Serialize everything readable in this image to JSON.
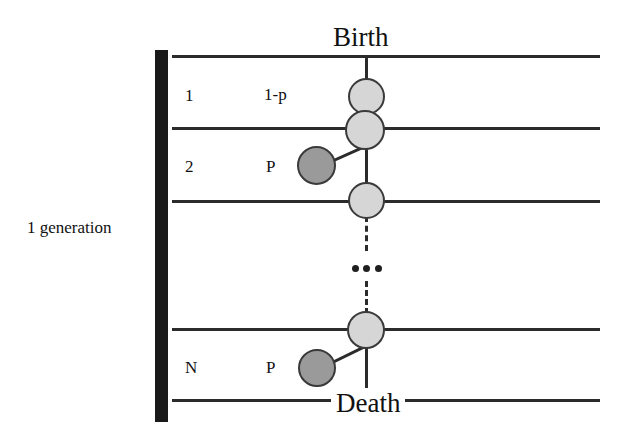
{
  "figure": {
    "title_top": "Birth",
    "title_bottom": "Death",
    "side_label": "1 generation"
  },
  "rows": [
    {
      "index": "1",
      "probability": "1-p"
    },
    {
      "index": "2",
      "probability": "P"
    },
    {
      "index": "N",
      "probability": "P"
    }
  ],
  "ellipsis": "...",
  "colors": {
    "line": "#2b2b2b",
    "bar": "#1a1a1a",
    "node_light": "#d6d6d6",
    "node_dark": "#9a9a9a",
    "node_stroke": "#3a3a3a",
    "text": "#111111",
    "background": "#ffffff"
  }
}
